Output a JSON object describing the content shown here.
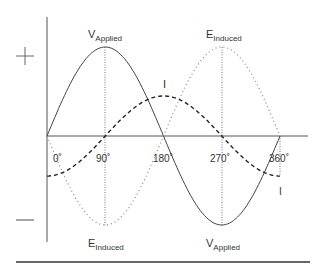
{
  "diagram": {
    "polarity": {
      "positive": "+",
      "negative": "—"
    },
    "angle_ticks": [
      "0˚",
      "90˚",
      "180˚",
      "270˚",
      "360˚"
    ],
    "labels": {
      "v_applied_top": {
        "main": "V",
        "sub": "Applied"
      },
      "e_induced_top": {
        "main": "E",
        "sub": "Induced"
      },
      "current_top": "I",
      "e_induced_bottom": {
        "main": "E",
        "sub": "Induced"
      },
      "v_applied_bottom": {
        "main": "V",
        "sub": "Applied"
      },
      "current_bottom": "I"
    },
    "series": [
      {
        "name": "V Applied",
        "style": "solid",
        "amplitude": 1.0,
        "phase_deg": 0
      },
      {
        "name": "E Induced",
        "style": "dotted",
        "amplitude": 1.0,
        "phase_deg": 180
      },
      {
        "name": "I",
        "style": "dashed",
        "amplitude": 0.45,
        "phase_deg": -90
      }
    ],
    "colors": {
      "axis": "#555555",
      "v_applied": "#444444",
      "e_induced": "#888888",
      "current": "#222222",
      "text": "#333333",
      "rule": "#333333"
    }
  }
}
